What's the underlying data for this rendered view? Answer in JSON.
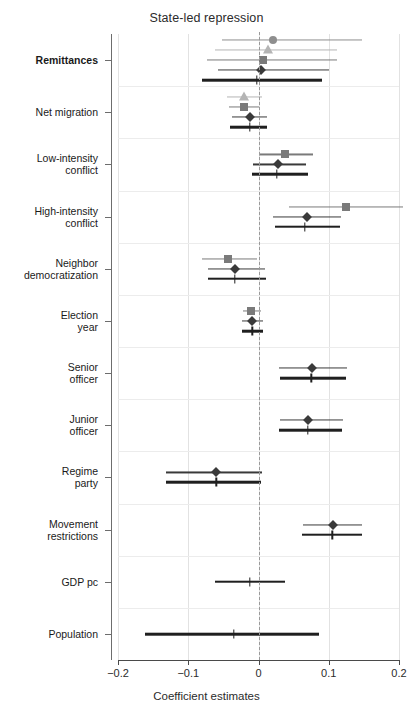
{
  "chart_data": {
    "type": "scatter",
    "subtype": "coefficient-forest-plot",
    "title": "State-led repression",
    "xlabel": "Coefficient estimates",
    "ylabel": "",
    "xlim": [
      -0.2,
      0.2
    ],
    "xticks": [
      -0.2,
      -0.1,
      0,
      0.1,
      0.2
    ],
    "xticklabels": [
      "−0.2",
      "−0.1",
      "0",
      "0.1",
      "0.2"
    ],
    "grid": "faint horizontal band separators and vertical gridlines at ticks",
    "reference_line": {
      "x": 0,
      "style": "dashed",
      "color": "#9a9a9a"
    },
    "legend": "none",
    "marker_styles": [
      {
        "name": "circle",
        "color": "#8e8e8e"
      },
      {
        "name": "triangle",
        "color": "#b4b4b4"
      },
      {
        "name": "square",
        "color": "#7a7a7a"
      },
      {
        "name": "diamond",
        "color": "#3a3a3a"
      },
      {
        "name": "line-only",
        "color": "#1f1f1f"
      }
    ],
    "categories": [
      "Remittances",
      "Net migration",
      "Low-intensity conflict",
      "High-intensity conflict",
      "Neighbor democratization",
      "Election year",
      "Senior officer",
      "Junior officer",
      "Regime party",
      "Movement restrictions",
      "GDP pc",
      "Population"
    ],
    "groups": [
      {
        "category": "Remittances",
        "estimates": [
          {
            "marker": "circle",
            "value": 0.021,
            "low": -0.052,
            "high": 0.148
          },
          {
            "marker": "triangle",
            "value": 0.013,
            "low": -0.062,
            "high": 0.112
          },
          {
            "marker": "square",
            "value": 0.006,
            "low": -0.073,
            "high": 0.112
          },
          {
            "marker": "diamond",
            "value": 0.003,
            "low": -0.058,
            "high": 0.1
          },
          {
            "marker": "line-only",
            "value": -0.002,
            "low": -0.081,
            "high": 0.09
          }
        ]
      },
      {
        "category": "Net migration",
        "estimates": [
          {
            "marker": "triangle",
            "value": -0.02,
            "low": -0.045,
            "high": 0.005
          },
          {
            "marker": "square",
            "value": -0.02,
            "low": -0.042,
            "high": 0.001
          },
          {
            "marker": "diamond",
            "value": -0.012,
            "low": -0.038,
            "high": 0.012
          },
          {
            "marker": "line-only",
            "value": -0.012,
            "low": -0.04,
            "high": 0.012
          }
        ]
      },
      {
        "category": "Low-intensity conflict",
        "estimates": [
          {
            "marker": "square",
            "value": 0.038,
            "low": 0.0,
            "high": 0.078
          },
          {
            "marker": "diamond",
            "value": 0.028,
            "low": -0.008,
            "high": 0.068
          },
          {
            "marker": "line-only",
            "value": 0.026,
            "low": -0.009,
            "high": 0.07
          }
        ]
      },
      {
        "category": "High-intensity conflict",
        "estimates": [
          {
            "marker": "square",
            "value": 0.125,
            "low": 0.043,
            "high": 0.205
          },
          {
            "marker": "diamond",
            "value": 0.069,
            "low": 0.02,
            "high": 0.118
          },
          {
            "marker": "line-only",
            "value": 0.066,
            "low": 0.023,
            "high": 0.116
          }
        ]
      },
      {
        "category": "Neighbor democratization",
        "estimates": [
          {
            "marker": "square",
            "value": -0.044,
            "low": -0.081,
            "high": -0.002
          },
          {
            "marker": "diamond",
            "value": -0.034,
            "low": -0.072,
            "high": 0.009
          },
          {
            "marker": "line-only",
            "value": -0.034,
            "low": -0.072,
            "high": 0.01
          }
        ]
      },
      {
        "category": "Election year",
        "estimates": [
          {
            "marker": "square",
            "value": -0.01,
            "low": -0.022,
            "high": 0.003
          },
          {
            "marker": "diamond",
            "value": -0.009,
            "low": -0.024,
            "high": 0.006
          },
          {
            "marker": "line-only",
            "value": -0.009,
            "low": -0.023,
            "high": 0.006
          }
        ]
      },
      {
        "category": "Senior officer",
        "estimates": [
          {
            "marker": "diamond",
            "value": 0.076,
            "low": 0.029,
            "high": 0.126
          },
          {
            "marker": "line-only",
            "value": 0.075,
            "low": 0.031,
            "high": 0.124
          }
        ]
      },
      {
        "category": "Junior officer",
        "estimates": [
          {
            "marker": "diamond",
            "value": 0.07,
            "low": 0.03,
            "high": 0.12
          },
          {
            "marker": "line-only",
            "value": 0.07,
            "low": 0.029,
            "high": 0.119
          }
        ]
      },
      {
        "category": "Regime party",
        "estimates": [
          {
            "marker": "diamond",
            "value": -0.06,
            "low": -0.131,
            "high": 0.005
          },
          {
            "marker": "line-only",
            "value": -0.06,
            "low": -0.132,
            "high": 0.004
          }
        ]
      },
      {
        "category": "Movement restrictions",
        "estimates": [
          {
            "marker": "diamond",
            "value": 0.106,
            "low": 0.064,
            "high": 0.148
          },
          {
            "marker": "line-only",
            "value": 0.105,
            "low": 0.062,
            "high": 0.148
          }
        ]
      },
      {
        "category": "GDP pc",
        "estimates": [
          {
            "marker": "line-only",
            "value": -0.012,
            "low": -0.062,
            "high": 0.038
          }
        ]
      },
      {
        "category": "Population",
        "estimates": [
          {
            "marker": "line-only",
            "value": -0.035,
            "low": -0.162,
            "high": 0.086
          }
        ]
      }
    ]
  },
  "axis": {
    "x_title": "Coefficient estimates",
    "tick_labels": [
      "−0.2",
      "−0.1",
      "0",
      "0.1",
      "0.2"
    ]
  },
  "y_categories": [
    {
      "label": "Remittances",
      "bold": true
    },
    {
      "label": "Net migration",
      "bold": false
    },
    {
      "label": "Low-intensity\nconflict",
      "bold": false
    },
    {
      "label": "High-intensity\nconflict",
      "bold": false
    },
    {
      "label": "Neighbor\ndemocratization",
      "bold": false
    },
    {
      "label": "Election\nyear",
      "bold": false
    },
    {
      "label": "Senior\nofficer",
      "bold": false
    },
    {
      "label": "Junior\nofficer",
      "bold": false
    },
    {
      "label": "Regime\nparty",
      "bold": false
    },
    {
      "label": "Movement\nrestrictions",
      "bold": false
    },
    {
      "label": "GDP pc",
      "bold": false
    },
    {
      "label": "Population",
      "bold": false
    }
  ],
  "title": "State-led repression"
}
